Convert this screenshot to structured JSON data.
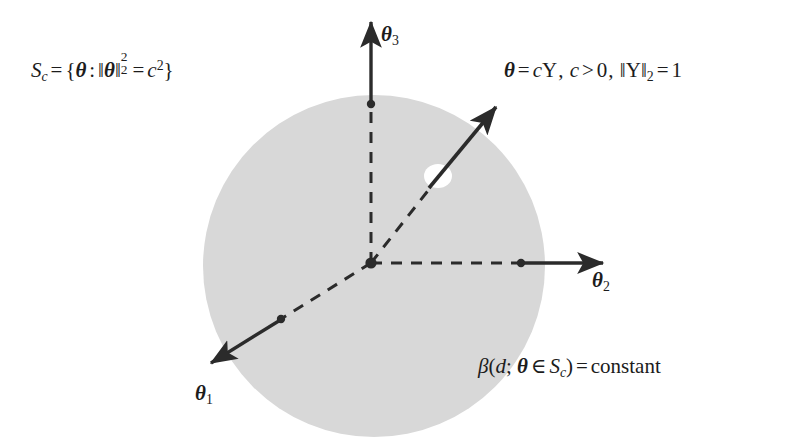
{
  "figure": {
    "type": "geometric-diagram",
    "background_color": "#ffffff",
    "sphere_fill_color": "#d8d8d8",
    "stroke_color": "#2b2b2b"
  },
  "formulas": {
    "sphere_set": {
      "latex": "S_c = \\{\\theta : \\|\\theta\\|_2^2 = c^2\\}",
      "plain": "S_c = { theta : ||theta||_2^2 = c^2 }",
      "parts": {
        "S": "S",
        "c_sub": "c",
        "equals": "=",
        "brace_open": "{",
        "theta": "θ",
        "colon": ":",
        "norm_bar": "‖",
        "norm_sub": "2",
        "norm_sup": "2",
        "equals2": "=",
        "c": "c",
        "c_sup": "2",
        "brace_close": "}"
      }
    },
    "theta_definition": {
      "latex": "\\theta = c\\Upsilon,\\; c > 0,\\; \\|\\Upsilon\\|_2 = 1",
      "plain": "theta = c Upsilon, c > 0, ||Upsilon||_2 = 1",
      "parts": {
        "theta": "θ",
        "equals": "=",
        "c": "c",
        "upsilon": "Υ",
        "comma1": ",",
        "c2": "c",
        "gt": ">",
        "zero": "0",
        "comma2": ",",
        "norm_bar": "‖",
        "upsilon2": "Υ",
        "norm_sub": "2",
        "equals2": "=",
        "one": "1"
      }
    },
    "beta_constant": {
      "latex": "\\beta(d;\\theta \\in S_c) = \\mathrm{constant}",
      "plain": "beta(d; theta in S_c) = constant",
      "parts": {
        "beta": "β",
        "paren_open": "(",
        "d": "d",
        "semicolon": ";",
        "theta": "θ",
        "in": "∈",
        "S": "S",
        "S_sub": "c",
        "paren_close": ")",
        "equals": "=",
        "constant": "constant"
      }
    }
  },
  "axes": [
    {
      "name": "theta1",
      "label": "θ",
      "subscript": "1",
      "direction": "down-left",
      "origin": [
        371,
        263
      ],
      "tick_point": [
        280,
        320
      ],
      "arrow_tip": [
        207,
        365
      ],
      "dashed_from_origin": true
    },
    {
      "name": "theta2",
      "label": "θ",
      "subscript": "2",
      "direction": "right",
      "origin": [
        371,
        263
      ],
      "tick_point": [
        521,
        263
      ],
      "arrow_tip": [
        607,
        263
      ],
      "dashed_from_origin": true
    },
    {
      "name": "theta3",
      "label": "θ",
      "subscript": "3",
      "direction": "up",
      "origin": [
        371,
        263
      ],
      "tick_point": [
        371,
        103
      ],
      "arrow_tip": [
        371,
        20
      ],
      "dashed_from_origin": true
    }
  ],
  "vector": {
    "name": "theta-vector",
    "label_ref": "theta_definition",
    "origin": [
      371,
      263
    ],
    "surface_point": [
      437,
      177
    ],
    "arrow_tip": [
      500,
      103
    ],
    "dashed_inside_sphere": true,
    "marker": {
      "shape": "ellipse",
      "center": [
        438,
        176
      ],
      "rx": 14,
      "ry": 12,
      "fill": "#ffffff"
    }
  },
  "sphere": {
    "name": "sphere-Sc",
    "center": [
      374,
      266
    ],
    "radius": 171,
    "fill": "#d8d8d8"
  },
  "origin_point": {
    "name": "origin-dot",
    "position": [
      371,
      263
    ],
    "radius": 5.5
  }
}
